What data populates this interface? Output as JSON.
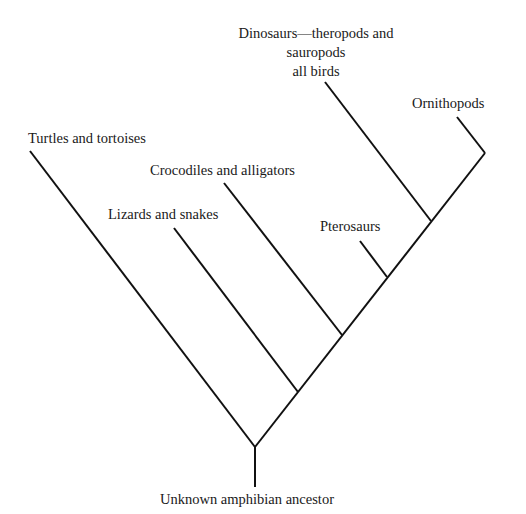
{
  "diagram": {
    "type": "cladogram",
    "root": {
      "label": "Unknown amphibian ancestor"
    },
    "leaves": {
      "turtles": "Turtles and tortoises",
      "lizards": "Lizards and snakes",
      "crocodiles": "Crocodiles and alligators",
      "pterosaurs": "Pterosaurs",
      "dinosaurs_line1": "Dinosaurs—theropods and",
      "dinosaurs_line2": "sauropods",
      "dinosaurs_line3": "all birds",
      "ornithopods": "Ornithopods"
    },
    "line_color": "#111111",
    "branching_order": [
      "Turtles and tortoises",
      "Lizards and snakes",
      "Crocodiles and alligators",
      "Pterosaurs",
      "Dinosaurs—theropods and sauropods all birds",
      "Ornithopods"
    ]
  }
}
